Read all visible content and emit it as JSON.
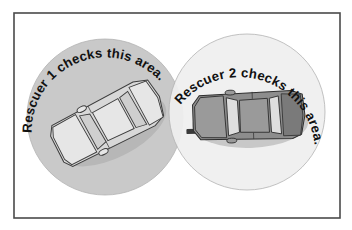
{
  "figure": {
    "background_color": "#ffffff",
    "frame": {
      "stroke_color": "#4a4a4a",
      "x": 14,
      "y": 13,
      "width": 326,
      "height": 205
    }
  },
  "zones": [
    {
      "id": "zone-left",
      "label": "Rescuer 1 checks this area.",
      "fill_color": "#c9c9c9",
      "center_x": 105,
      "center_y": 117,
      "radius": 78,
      "car": {
        "id": "car-left",
        "color_name": "light-gray",
        "body_color": "#d8d8d8",
        "rotation_deg": -27,
        "view": "top-down"
      }
    },
    {
      "id": "zone-right",
      "label": "Rescuer 2 checks this area.",
      "fill_color": "#efefef",
      "center_x": 247,
      "center_y": 112,
      "radius": 78,
      "car": {
        "id": "car-right",
        "color_name": "dark-gray",
        "body_color": "#8d8d8d",
        "rotation_deg": -2,
        "view": "top-down"
      }
    }
  ],
  "colors": {
    "page_background": "#ffffff",
    "frame_stroke": "#4a4a4a",
    "left_zone_fill": "#c9c9c9",
    "right_zone_fill": "#efefef",
    "label_text": "#111111",
    "light_car_body": "#d8d8d8",
    "dark_car_body": "#8d8d8d"
  }
}
